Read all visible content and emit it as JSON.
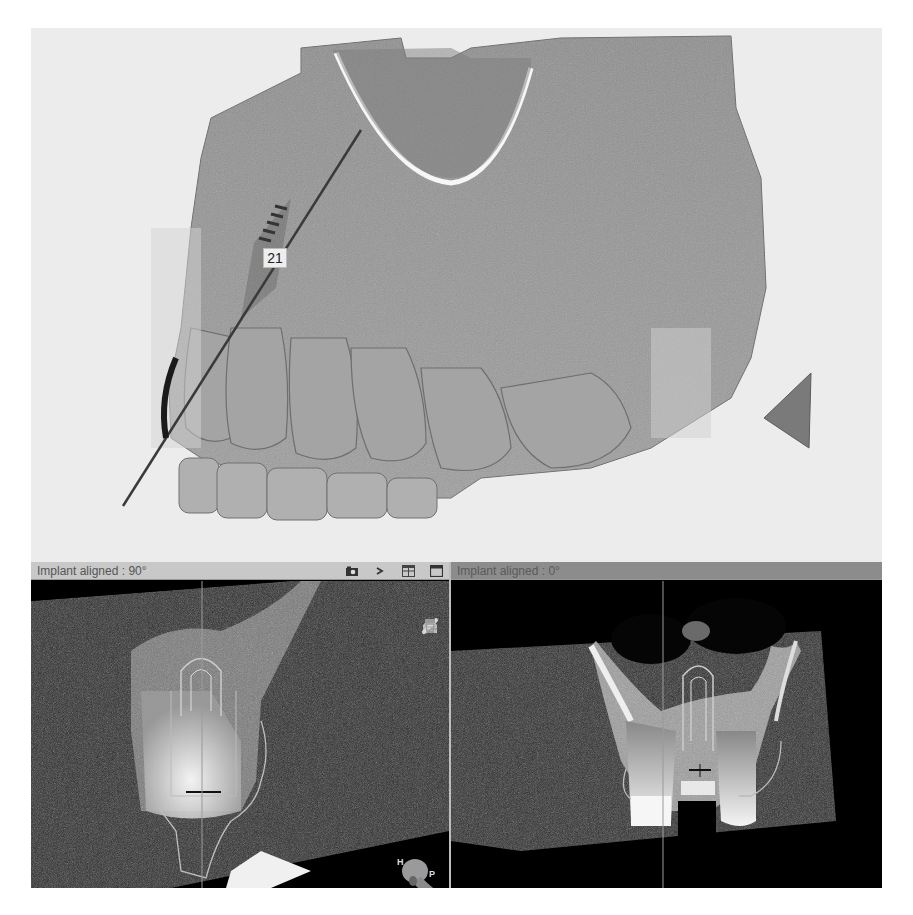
{
  "view3d": {
    "implant_label": "21",
    "background_color": "#ececec"
  },
  "panes": [
    {
      "title": "Implant aligned : 90°",
      "toolbar": [
        {
          "name": "screenshot-icon"
        },
        {
          "name": "next-icon",
          "glyph": ">"
        },
        {
          "name": "layout-grid-icon"
        },
        {
          "name": "maximize-window-icon"
        }
      ],
      "side_tools": [
        {
          "name": "bone-density-icon"
        },
        {
          "name": "nerve-icon"
        },
        {
          "name": "measure-ruler-icon"
        },
        {
          "name": "implant-library-icon"
        }
      ],
      "orientation": {
        "head": "H",
        "posterior": "P"
      }
    },
    {
      "title": "Implant aligned : 0°"
    }
  ],
  "colors": {
    "header_left": "#c8c8c8",
    "header_right": "#8c8c8c",
    "slice_bg": "#000000",
    "guide_line": "#9a9a9a"
  }
}
